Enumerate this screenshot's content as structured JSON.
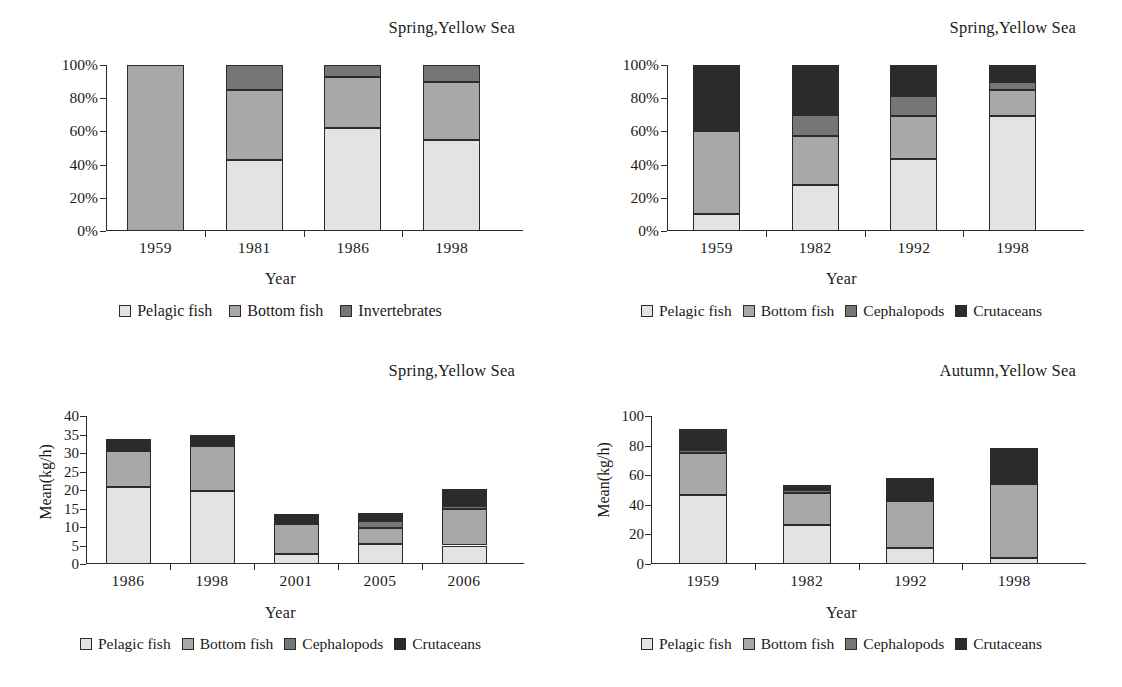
{
  "figure": {
    "axis_title_x": "Year",
    "axis_title_y": "Mean(kg/h)",
    "colors": {
      "pelagic": "#e3e3e1",
      "bottom": "#a8a8a6",
      "cephalopods": "#767674",
      "crutaceans": "#2b2b2b",
      "invertebrates": "#767674",
      "axis": "#2a2a2a"
    }
  },
  "panels": {
    "top_left": {
      "title": "Spring,Yellow Sea",
      "xlabel": "Year",
      "ylabels": [
        "100%",
        "80%",
        "60%",
        "40%",
        "20%",
        "0%"
      ],
      "categories": [
        "1959",
        "1981",
        "1986",
        "1998"
      ],
      "legend": [
        "Pelagic fish",
        "Bottom fish",
        "Invertebrates"
      ]
    },
    "top_right": {
      "title": "Spring,Yellow Sea",
      "xlabel": "Year",
      "ylabels": [
        "100%",
        "80%",
        "60%",
        "40%",
        "20%",
        "0%"
      ],
      "categories": [
        "1959",
        "1982",
        "1992",
        "1998"
      ],
      "legend": [
        "Pelagic fish",
        "Bottom fish",
        "Cephalopods",
        "Crutaceans"
      ]
    },
    "bottom_left": {
      "title": "Spring,Yellow Sea",
      "xlabel": "Year",
      "ylabel": "Mean(kg/h)",
      "ylabels": [
        "40",
        "35",
        "30",
        "25",
        "20",
        "15",
        "10",
        "5",
        "0"
      ],
      "categories": [
        "1986",
        "1998",
        "2001",
        "2005",
        "2006"
      ],
      "legend": [
        "Pelagic fish",
        "Bottom fish",
        "Cephalopods",
        "Crutaceans"
      ]
    },
    "bottom_right": {
      "title": "Autumn,Yellow Sea",
      "xlabel": "Year",
      "ylabel": "Mean(kg/h)",
      "ylabels": [
        "100",
        "80",
        "60",
        "40",
        "20",
        "0"
      ],
      "categories": [
        "1959",
        "1982",
        "1992",
        "1998"
      ],
      "legend": [
        "Pelagic fish",
        "Bottom fish",
        "Cephalopods",
        "Crutaceans"
      ]
    }
  },
  "chart_data": [
    {
      "id": "top_left",
      "type": "bar",
      "stacked": true,
      "title": "Spring,Yellow Sea",
      "xlabel": "Year",
      "ylabel": "",
      "ylim": [
        0,
        100
      ],
      "yticks": [
        0,
        20,
        40,
        60,
        80,
        100
      ],
      "ytick_labels": [
        "0%",
        "20%",
        "40%",
        "60%",
        "80%",
        "100%"
      ],
      "grid": false,
      "legend_position": "bottom",
      "categories": [
        "1959",
        "1981",
        "1986",
        "1998"
      ],
      "series": [
        {
          "name": "Pelagic fish",
          "color": "#e3e3e1",
          "values": [
            0,
            43,
            62,
            55
          ]
        },
        {
          "name": "Bottom fish",
          "color": "#a8a8a6",
          "values": [
            100,
            42,
            31,
            35
          ]
        },
        {
          "name": "Invertebrates",
          "color": "#767674",
          "values": [
            0,
            15,
            7,
            10
          ]
        }
      ]
    },
    {
      "id": "top_right",
      "type": "bar",
      "stacked": true,
      "title": "Spring,Yellow Sea",
      "xlabel": "Year",
      "ylabel": "",
      "ylim": [
        0,
        100
      ],
      "yticks": [
        0,
        20,
        40,
        60,
        80,
        100
      ],
      "ytick_labels": [
        "0%",
        "20%",
        "40%",
        "60%",
        "80%",
        "100%"
      ],
      "grid": false,
      "legend_position": "bottom",
      "categories": [
        "1959",
        "1982",
        "1992",
        "1998"
      ],
      "series": [
        {
          "name": "Pelagic fish",
          "color": "#e3e3e1",
          "values": [
            10,
            27.5,
            43.5,
            69.5
          ]
        },
        {
          "name": "Bottom fish",
          "color": "#a8a8a6",
          "values": [
            50,
            29.5,
            25.5,
            15.5
          ]
        },
        {
          "name": "Cephalopods",
          "color": "#767674",
          "values": [
            0,
            13,
            12.5,
            5
          ]
        },
        {
          "name": "Crutaceans",
          "color": "#2b2b2b",
          "values": [
            40,
            30,
            18.5,
            10
          ]
        }
      ]
    },
    {
      "id": "bottom_left",
      "type": "bar",
      "stacked": true,
      "title": "Spring,Yellow Sea",
      "xlabel": "Year",
      "ylabel": "Mean(kg/h)",
      "ylim": [
        0,
        40
      ],
      "yticks": [
        0,
        5,
        10,
        15,
        20,
        25,
        30,
        35,
        40
      ],
      "ytick_labels": [
        "0",
        "5",
        "10",
        "15",
        "20",
        "25",
        "30",
        "35",
        "40"
      ],
      "grid": false,
      "legend_position": "bottom",
      "categories": [
        "1986",
        "1998",
        "2001",
        "2005",
        "2006"
      ],
      "series": [
        {
          "name": "Pelagic fish",
          "color": "#e3e3e1",
          "values": [
            20.8,
            19.6,
            2.7,
            5.5,
            5.0
          ]
        },
        {
          "name": "Bottom fish",
          "color": "#a8a8a6",
          "values": [
            9.7,
            12.2,
            8.1,
            4.1,
            9.8
          ]
        },
        {
          "name": "Cephalopods",
          "color": "#767674",
          "values": [
            0.6,
            0,
            0,
            2.1,
            1.0
          ]
        },
        {
          "name": "Crutaceans",
          "color": "#2b2b2b",
          "values": [
            2.7,
            3.2,
            2.8,
            2.1,
            4.4
          ]
        }
      ]
    },
    {
      "id": "bottom_right",
      "type": "bar",
      "stacked": true,
      "title": "Autumn,Yellow Sea",
      "xlabel": "Year",
      "ylabel": "Mean(kg/h)",
      "ylim": [
        0,
        100
      ],
      "yticks": [
        0,
        20,
        40,
        60,
        80,
        100
      ],
      "ytick_labels": [
        "0",
        "20",
        "40",
        "60",
        "80",
        "100"
      ],
      "grid": false,
      "legend_position": "bottom",
      "categories": [
        "1959",
        "1982",
        "1992",
        "1998"
      ],
      "series": [
        {
          "name": "Pelagic fish",
          "color": "#e3e3e1",
          "values": [
            46.5,
            26.5,
            11.0,
            4.0
          ]
        },
        {
          "name": "Bottom fish",
          "color": "#a8a8a6",
          "values": [
            28.5,
            21.5,
            31.5,
            50.0
          ]
        },
        {
          "name": "Cephalopods",
          "color": "#767674",
          "values": [
            2.0,
            2.0,
            0,
            0
          ]
        },
        {
          "name": "Crutaceans",
          "color": "#2b2b2b",
          "values": [
            14.0,
            3.5,
            15.5,
            24.5
          ]
        }
      ]
    }
  ]
}
